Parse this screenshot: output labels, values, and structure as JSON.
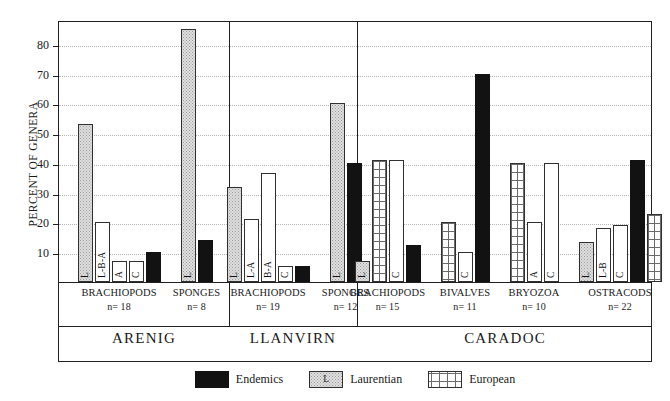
{
  "chart_data": {
    "type": "bar",
    "title": "",
    "xlabel": "",
    "ylabel": "PERCENT OF GENERA",
    "ylim": [
      0,
      88
    ],
    "yticks": [
      10,
      20,
      30,
      40,
      50,
      60,
      70,
      80
    ],
    "grid": true,
    "legend_position": "bottom-center",
    "legend": [
      {
        "key": "endemic",
        "label": "Endemics",
        "pattern": "solid-black",
        "color": "#121212"
      },
      {
        "key": "laurentian",
        "label": "Laurentian",
        "pattern": "stippled",
        "color": "#e0e0e0",
        "swatch_letter": "L"
      },
      {
        "key": "european",
        "label": "European",
        "pattern": "grid",
        "color": "#ffffff"
      }
    ],
    "stages": [
      {
        "name": "ARENIG",
        "groups": [
          {
            "taxon": "BRACHIOPODS",
            "n_label": "n= 18",
            "n": 18,
            "bars": [
              {
                "label": "L",
                "value": 53,
                "fill": "laurentian"
              },
              {
                "label": "L-B-A",
                "value": 20,
                "fill": "white"
              },
              {
                "label": "A",
                "value": 7,
                "fill": "white"
              },
              {
                "label": "C",
                "value": 7,
                "fill": "white"
              },
              {
                "label": "",
                "value": 10,
                "fill": "endemic"
              }
            ]
          },
          {
            "taxon": "SPONGES",
            "n_label": "n= 8",
            "n": 8,
            "bars": [
              {
                "label": "L",
                "value": 85,
                "fill": "laurentian"
              },
              {
                "label": "",
                "value": 14,
                "fill": "endemic"
              }
            ]
          }
        ]
      },
      {
        "name": "LLANVIRN",
        "groups": [
          {
            "taxon": "BRACHIOPODS",
            "n_label": "n= 19",
            "n": 19,
            "bars": [
              {
                "label": "L",
                "value": 32,
                "fill": "laurentian"
              },
              {
                "label": "L-A",
                "value": 21,
                "fill": "white"
              },
              {
                "label": "B-A",
                "value": 36.5,
                "fill": "white"
              },
              {
                "label": "C",
                "value": 5.5,
                "fill": "white"
              },
              {
                "label": "",
                "value": 5.5,
                "fill": "endemic"
              }
            ]
          },
          {
            "taxon": "SPONGES",
            "n_label": "n= 12",
            "n": 12,
            "bars": [
              {
                "label": "L",
                "value": 60,
                "fill": "laurentian"
              },
              {
                "label": "",
                "value": 40,
                "fill": "endemic"
              }
            ]
          }
        ]
      },
      {
        "name": "CARADOC",
        "groups": [
          {
            "taxon": "BRACHIOPODS",
            "n_label": "n= 15",
            "n": 15,
            "bars": [
              {
                "label": "L",
                "value": 7,
                "fill": "laurentian"
              },
              {
                "label": "",
                "value": 41,
                "fill": "european"
              },
              {
                "label": "C",
                "value": 41,
                "fill": "white"
              },
              {
                "label": "",
                "value": 12.5,
                "fill": "endemic"
              }
            ]
          },
          {
            "taxon": "BIVALVES",
            "n_label": "n= 11",
            "n": 11,
            "bars": [
              {
                "label": "",
                "value": 20,
                "fill": "european"
              },
              {
                "label": "C",
                "value": 10,
                "fill": "white"
              },
              {
                "label": "",
                "value": 70,
                "fill": "endemic"
              }
            ]
          },
          {
            "taxon": "BRYOZOA",
            "n_label": "n= 10",
            "n": 10,
            "bars": [
              {
                "label": "",
                "value": 40,
                "fill": "european"
              },
              {
                "label": "A",
                "value": 20,
                "fill": "white"
              },
              {
                "label": "C",
                "value": 40,
                "fill": "white"
              }
            ]
          },
          {
            "taxon": "OSTRACODS",
            "n_label": "n= 22",
            "n": 22,
            "bars": [
              {
                "label": "L",
                "value": 13.5,
                "fill": "laurentian"
              },
              {
                "label": "L-B",
                "value": 18,
                "fill": "white"
              },
              {
                "label": "C",
                "value": 19,
                "fill": "white"
              },
              {
                "label": "",
                "value": 41,
                "fill": "endemic"
              },
              {
                "label": "",
                "value": 23,
                "fill": "european"
              }
            ]
          }
        ]
      }
    ]
  }
}
